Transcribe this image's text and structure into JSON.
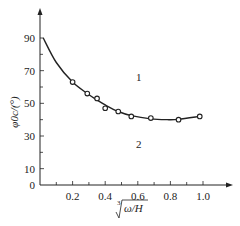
{
  "chart_data": {
    "type": "line",
    "title": "",
    "xlabel": "∛(ω/H)",
    "ylabel": "φ0c/(°)",
    "xlim": [
      0,
      1.1
    ],
    "ylim": [
      0,
      95
    ],
    "grid": false,
    "x_ticks": [
      0.2,
      0.4,
      0.6,
      0.8,
      1.0
    ],
    "x_tick_labels": [
      "0.2",
      "0.4",
      "0.6",
      "0.8",
      "1.0"
    ],
    "x_minor_ticks": [
      0.1,
      0.3,
      0.5,
      0.7,
      0.9
    ],
    "y_ticks": [
      0,
      10,
      30,
      50,
      70,
      90
    ],
    "y_tick_labels": [
      "0",
      "10",
      "30",
      "50",
      "70",
      "90"
    ],
    "y_minor_ticks": [
      20,
      40,
      60,
      80
    ],
    "series": [
      {
        "name": "measured",
        "style": "open-circle markers",
        "x": [
          0.2,
          0.29,
          0.35,
          0.4,
          0.48,
          0.56,
          0.68,
          0.85,
          0.98
        ],
        "y": [
          63,
          56,
          53,
          47,
          45,
          42,
          41,
          40,
          42
        ]
      },
      {
        "name": "fitted curve",
        "style": "solid line",
        "x": [
          0.02,
          0.1,
          0.2,
          0.29,
          0.35,
          0.4,
          0.48,
          0.56,
          0.68,
          0.78,
          0.85,
          0.98
        ],
        "y": [
          90,
          75,
          63,
          56,
          52,
          49,
          45,
          42.5,
          40.5,
          40,
          40.2,
          42
        ]
      }
    ],
    "annotations": [
      {
        "text": "1",
        "x": 0.59,
        "y": 66,
        "meaning": "region above curve"
      },
      {
        "text": "2",
        "x": 0.6,
        "y": 25,
        "meaning": "region below curve"
      }
    ],
    "legend": null
  },
  "labels": {
    "region_1": "1",
    "region_2": "2",
    "x_axis_title_radicand": "ω/H",
    "x_axis_title_index": "3",
    "y_axis_title": "φ0c/(°)"
  }
}
